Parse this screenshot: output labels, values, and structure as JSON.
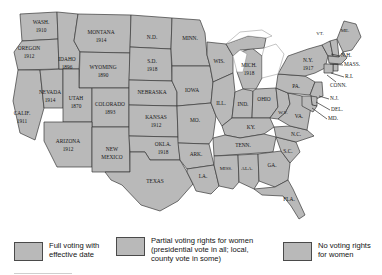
{
  "map": {
    "title": "Women's voting rights by state",
    "fill_color": "#b9b9b9",
    "border_color": "#3a3a3a",
    "background_color": "#ffffff",
    "states": [
      {
        "id": "wash",
        "name": "WASH.",
        "date": "1910",
        "x": 41,
        "y": 26,
        "size": "sm"
      },
      {
        "id": "oreg",
        "name": "OREGON",
        "date": "1912",
        "x": 29,
        "y": 52,
        "size": "sm"
      },
      {
        "id": "calif",
        "name": "CALIF.",
        "date": "1911",
        "x": 22,
        "y": 117,
        "size": "sm"
      },
      {
        "id": "nev",
        "name": "NEVADA",
        "date": "1914",
        "x": 49,
        "y": 96,
        "size": "sm"
      },
      {
        "id": "idaho",
        "name": "IDAHO",
        "date": "1896",
        "x": 65,
        "y": 63,
        "size": "sm"
      },
      {
        "id": "mont",
        "name": "MONTANA",
        "date": "1914",
        "x": 98,
        "y": 36,
        "size": "sm"
      },
      {
        "id": "wyo",
        "name": "WYOMING",
        "date": "1890",
        "x": 96,
        "y": 73,
        "size": "sm"
      },
      {
        "id": "utah",
        "name": "UTAH",
        "date": "1870",
        "x": 72,
        "y": 107,
        "size": "sm"
      },
      {
        "id": "ariz",
        "name": "ARIZONA",
        "date": "1912",
        "x": 66,
        "y": 148,
        "size": "sm"
      },
      {
        "id": "colo",
        "name": "COLORADO",
        "date": "1893",
        "x": 112,
        "y": 113,
        "size": "sm"
      },
      {
        "id": "nmex",
        "name": "NEW\nMEXICO",
        "date": "",
        "x": 113,
        "y": 157,
        "size": "sm"
      },
      {
        "id": "nd",
        "name": "N.D.",
        "date": "",
        "x": 152,
        "y": 40,
        "size": "sm"
      },
      {
        "id": "sd",
        "name": "S.D.",
        "date": "1918",
        "x": 155,
        "y": 67,
        "size": "sm"
      },
      {
        "id": "nebr",
        "name": "NEBRASKA",
        "date": "",
        "x": 157,
        "y": 93,
        "size": "sm"
      },
      {
        "id": "kans",
        "name": "KANSAS",
        "date": "1912",
        "x": 160,
        "y": 122,
        "size": "sm"
      },
      {
        "id": "okla",
        "name": "OKLA.",
        "date": "1918",
        "x": 167,
        "y": 152,
        "size": "sm"
      },
      {
        "id": "texas",
        "name": "TEXAS",
        "date": "",
        "x": 159,
        "y": 185,
        "size": "sm"
      },
      {
        "id": "minn",
        "name": "MINN.",
        "date": "",
        "x": 190,
        "y": 41,
        "size": "sm"
      },
      {
        "id": "iowa",
        "name": "IOWA",
        "date": "",
        "x": 192,
        "y": 92,
        "size": "sm"
      },
      {
        "id": "mo",
        "name": "MO.",
        "date": "",
        "x": 196,
        "y": 122,
        "size": "sm"
      },
      {
        "id": "ark",
        "name": "ARK.",
        "date": "",
        "x": 200,
        "y": 155,
        "size": "sm"
      },
      {
        "id": "la",
        "name": "LA.",
        "date": "",
        "x": 208,
        "y": 182,
        "size": "sm"
      },
      {
        "id": "wis",
        "name": "WIS.",
        "date": "",
        "x": 219,
        "y": 61,
        "size": "sm"
      },
      {
        "id": "ill",
        "name": "ILL.",
        "date": "",
        "x": 221,
        "y": 105,
        "size": "sm"
      },
      {
        "id": "mich",
        "name": "MICH.",
        "date": "1918",
        "x": 247,
        "y": 71,
        "size": "sm"
      },
      {
        "id": "ind",
        "name": "IND.",
        "date": "",
        "x": 244,
        "y": 106,
        "size": "sm"
      },
      {
        "id": "ohio",
        "name": "OHIO",
        "date": "",
        "x": 265,
        "y": 101,
        "size": "sm"
      },
      {
        "id": "ky",
        "name": "KY.",
        "date": "",
        "x": 253,
        "y": 130,
        "size": "sm"
      },
      {
        "id": "tenn",
        "name": "TENN.",
        "date": "",
        "x": 247,
        "y": 148,
        "size": "sm"
      },
      {
        "id": "miss",
        "name": "MISS.",
        "date": "",
        "x": 228,
        "y": 170,
        "size": "sm"
      },
      {
        "id": "ala",
        "name": "ALA.",
        "date": "",
        "x": 248,
        "y": 170,
        "size": "sm"
      },
      {
        "id": "ga",
        "name": "GA.",
        "date": "",
        "x": 272,
        "y": 165,
        "size": "sm"
      },
      {
        "id": "fla",
        "name": "FLA.",
        "date": "",
        "x": 290,
        "y": 203,
        "size": "sm"
      },
      {
        "id": "sc",
        "name": "S.C.",
        "date": "",
        "x": 288,
        "y": 152,
        "size": "sm"
      },
      {
        "id": "nc",
        "name": "N.C.",
        "date": "",
        "x": 293,
        "y": 139,
        "size": "sm"
      },
      {
        "id": "wv",
        "name": "W.V.",
        "date": "",
        "x": 281,
        "y": 117,
        "size": "sm"
      },
      {
        "id": "va",
        "name": "VA.",
        "date": "",
        "x": 296,
        "y": 125,
        "size": "sm"
      },
      {
        "id": "pa",
        "name": "PA.",
        "date": "",
        "x": 296,
        "y": 90,
        "size": "sm"
      },
      {
        "id": "ny",
        "name": "N.Y.",
        "date": "1917",
        "x": 312,
        "y": 62,
        "size": "sm"
      },
      {
        "id": "vt",
        "name": "VT.",
        "date": "",
        "x": 322,
        "y": 33,
        "size": "xs"
      },
      {
        "id": "me",
        "name": "ME.",
        "date": "",
        "x": 345,
        "y": 31,
        "size": "xs"
      }
    ],
    "callouts": [
      {
        "id": "nh",
        "label": "N.H.",
        "text_x": 341,
        "text_y": 56,
        "line": "M 340 56 L 331 54"
      },
      {
        "id": "mass",
        "label": "MASS.",
        "text_x": 344,
        "text_y": 65,
        "line": "M 343 65 L 330 64"
      },
      {
        "id": "ri",
        "label": "R.I.",
        "text_x": 345,
        "text_y": 77,
        "line": "M 344 77 L 331 74"
      },
      {
        "id": "conn",
        "label": "CONN.",
        "text_x": 333,
        "text_y": 85,
        "line": "M 337 82 L 327 76"
      },
      {
        "id": "nj",
        "label": "N.J.",
        "text_x": 330,
        "text_y": 99,
        "line": "M 329 99 L 318 96"
      },
      {
        "id": "del",
        "label": "DEL.",
        "text_x": 331,
        "text_y": 110,
        "line": "M 330 110 L 316 103"
      },
      {
        "id": "md",
        "label": "MD.",
        "text_x": 328,
        "text_y": 119,
        "line": "M 327 119 L 312 108"
      }
    ]
  },
  "legend": {
    "items": [
      {
        "id": "full",
        "label": "Full voting with\neffective date",
        "swatch_color": "#b9b9b9"
      },
      {
        "id": "partial",
        "label": "Partial voting rights for women\n(presidential vote in all; local,\ncounty vote in some)",
        "swatch_color": "#b9b9b9"
      },
      {
        "id": "none",
        "label": "No voting rights\nfor women",
        "swatch_color": "#b9b9b9"
      }
    ]
  }
}
